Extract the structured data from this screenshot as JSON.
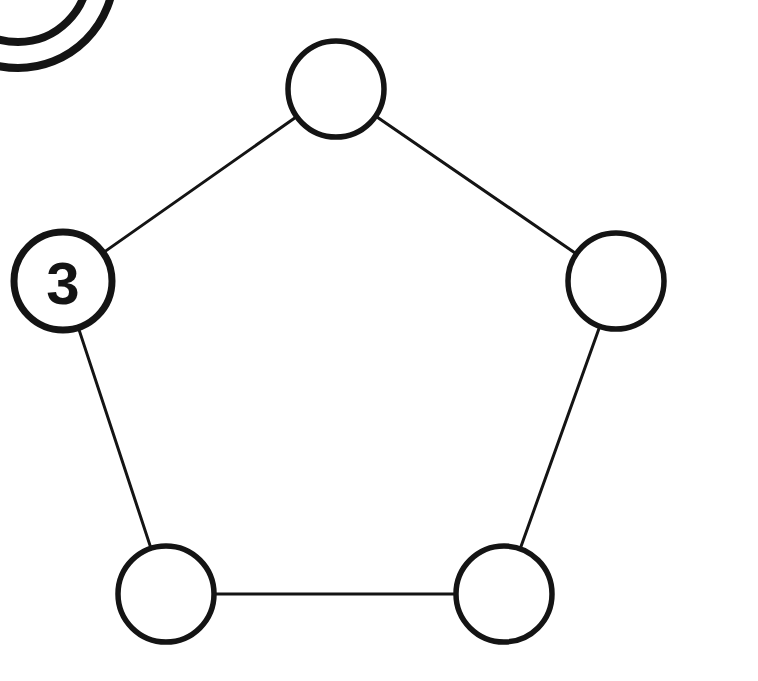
{
  "figure": {
    "type": "graph-diagram",
    "background_color": "#ffffff",
    "ink_color": "#141414",
    "width": 758,
    "height": 681
  },
  "graph_data": {
    "type": "node-link-diagram",
    "shape": "pentagon",
    "node_count": 5,
    "edge_count": 5,
    "nodes": [
      {
        "id": "top",
        "name": "node-top",
        "label": "",
        "cx": 336,
        "cy": 89,
        "r": 48,
        "stroke_width": 5.5
      },
      {
        "id": "left",
        "name": "node-left-labeled-3",
        "label": "3",
        "cx": 63,
        "cy": 281,
        "r": 49,
        "stroke_width": 7
      },
      {
        "id": "right",
        "name": "node-right",
        "label": "",
        "cx": 616,
        "cy": 281,
        "r": 48,
        "stroke_width": 5.5
      },
      {
        "id": "bottom-left",
        "name": "node-bottom-left",
        "label": "",
        "cx": 166,
        "cy": 594,
        "r": 48,
        "stroke_width": 5.5
      },
      {
        "id": "bottom-right",
        "name": "node-bottom-right",
        "label": "",
        "cx": 504,
        "cy": 594,
        "r": 48,
        "stroke_width": 5.5
      }
    ],
    "edges": [
      {
        "name": "edge-left-top",
        "from": "left",
        "to": "top",
        "stroke_width": 3
      },
      {
        "name": "edge-top-right",
        "from": "top",
        "to": "right",
        "stroke_width": 3
      },
      {
        "name": "edge-right-bottom-right",
        "from": "right",
        "to": "bottom-right",
        "stroke_width": 3
      },
      {
        "name": "edge-bottom-right-bottom-left",
        "from": "bottom-right",
        "to": "bottom-left",
        "stroke_width": 3
      },
      {
        "name": "edge-bottom-left-left",
        "from": "bottom-left",
        "to": "left",
        "stroke_width": 3
      }
    ],
    "corner_artifact": {
      "name": "partial-circle-top-left-corner",
      "description": "Two concentric arcs of a circle cut off at the top-left corner of the page",
      "cx": 18,
      "cy": -28,
      "outer_r": 96,
      "inner_r": 70,
      "stroke_width": 8
    }
  },
  "labels": {
    "left_node_value": "3"
  }
}
